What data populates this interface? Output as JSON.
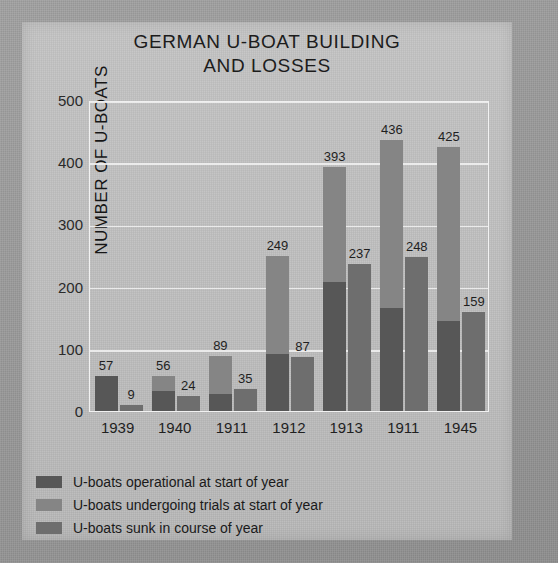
{
  "chart_data": {
    "type": "bar",
    "title": "GERMAN U-BOAT BUILDING AND LOSSES",
    "title_line1": "GERMAN U-BOAT BUILDING",
    "title_line2": "AND LOSSES",
    "xlabel": "",
    "ylabel": "NUMBER OF U-BOATS",
    "ylim": [
      0,
      500
    ],
    "yticks": [
      500,
      400,
      300,
      200,
      100,
      0
    ],
    "grid": true,
    "legend_position": "bottom-left",
    "categories": [
      "1939",
      "1940",
      "1911",
      "1912",
      "1913",
      "1911",
      "1945"
    ],
    "x": [
      "1939",
      "1940",
      "1941",
      "1942",
      "1943",
      "1944",
      "1945"
    ],
    "series": [
      {
        "name": "U-boats operational at start of year",
        "color": "#575757",
        "values": [
          57,
          32,
          27,
          91,
          207,
          165,
          145
        ]
      },
      {
        "name": "U-boats undergoing trials at start of year",
        "color": "#858585",
        "values": [
          0,
          24,
          62,
          158,
          186,
          271,
          280
        ]
      },
      {
        "name": "U-boats sunk in course of year",
        "color": "#6e6e6e",
        "values": [
          9,
          24,
          35,
          87,
          237,
          248,
          159
        ]
      }
    ],
    "stacked_totals": [
      57,
      56,
      89,
      249,
      393,
      436,
      425
    ],
    "bar_labels": {
      "totals": [
        "57",
        "56",
        "89",
        "249",
        "393",
        "436",
        "425"
      ],
      "sunk": [
        "9",
        "24",
        "35",
        "87",
        "237",
        "248",
        "159"
      ]
    },
    "xticklabels": [
      "1939",
      "1940",
      "1911",
      "1912",
      "1913",
      "1911",
      "1945"
    ],
    "legend": [
      "U-boats operational at start of year",
      "U-boats undergoing trials at start of year",
      "U-boats sunk in course of year"
    ],
    "colors": {
      "operational": "#575757",
      "trials": "#858585",
      "sunk": "#6e6e6e",
      "plot_background": "#bdbdbd",
      "gridline": "#f0f0f0",
      "page_background": "#9a9a9a",
      "text": "#1a1a1a"
    }
  }
}
